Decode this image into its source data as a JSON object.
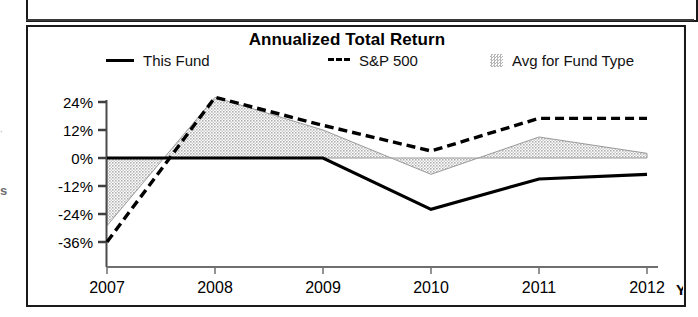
{
  "panel": {
    "title": "Annualized Total Return"
  },
  "legend": {
    "items": [
      {
        "label": "This Fund",
        "marker": "solid-line-swatch"
      },
      {
        "label": "S&P 500",
        "marker": "dashed-line-swatch"
      },
      {
        "label": "Avg for Fund Type",
        "marker": "area-fill-swatch"
      }
    ]
  },
  "axes": {
    "y_ticks": [
      "24%",
      "12%",
      "0%",
      "-12%",
      "-24%",
      "-36%"
    ],
    "x_ticks": [
      "2007",
      "2008",
      "2009",
      "2010",
      "2011",
      "2012"
    ],
    "ytd_label": "YT"
  },
  "colors": {
    "line": "#000000",
    "area_fill": "#c8c8c8",
    "area_edge": "#9a9a9a",
    "frame": "#1a1a1a",
    "background": "#ffffff"
  },
  "chart_data": {
    "type": "line",
    "title": "Annualized Total Return",
    "xlabel": "",
    "ylabel": "",
    "x": [
      "2007",
      "2008",
      "2009",
      "2010",
      "2011",
      "2012"
    ],
    "categories": [
      "2007",
      "2008",
      "2009",
      "2010",
      "2011",
      "2012"
    ],
    "series": [
      {
        "name": "This Fund",
        "style": "solid",
        "color": "#000000",
        "values": [
          0,
          0,
          0,
          -22,
          -9,
          -7
        ]
      },
      {
        "name": "S&P 500",
        "style": "dashed",
        "color": "#000000",
        "values": [
          -36,
          26,
          14,
          3,
          17,
          17
        ]
      },
      {
        "name": "Avg for Fund Type",
        "style": "area",
        "color": "#c8c8c8",
        "values": [
          -29,
          26,
          12,
          -7,
          9,
          2
        ]
      }
    ],
    "ylim": [
      -40,
      30
    ],
    "yticks": [
      24,
      12,
      0,
      -12,
      -24,
      -36
    ],
    "ytick_labels": [
      "24%",
      "12%",
      "0%",
      "-12%",
      "-24%",
      "-36%"
    ],
    "grid": false,
    "legend_position": "top",
    "note": "Last x category is year-to-date (YTD); label truncated to 'YT' at image edge."
  },
  "artifacts": {
    "left_fragment_upper": "·",
    "left_fragment_lower": "s"
  }
}
